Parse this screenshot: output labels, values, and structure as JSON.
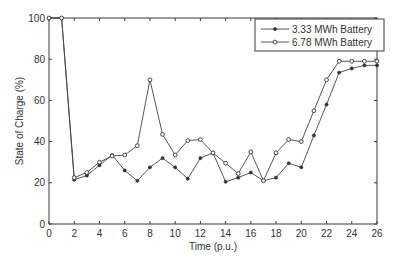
{
  "chart_data": {
    "type": "line",
    "title": "",
    "xlabel": "Time (p.u.)",
    "ylabel": "State of Charge (%)",
    "xlim": [
      0,
      26
    ],
    "ylim": [
      0,
      100
    ],
    "xticks": [
      0,
      2,
      4,
      6,
      8,
      10,
      12,
      14,
      16,
      18,
      20,
      22,
      24,
      26
    ],
    "yticks": [
      0,
      20,
      40,
      60,
      80,
      100
    ],
    "grid": false,
    "legend_position": "upper right",
    "x": [
      0,
      1,
      2,
      3,
      4,
      5,
      6,
      7,
      8,
      9,
      10,
      11,
      12,
      13,
      14,
      15,
      16,
      17,
      18,
      19,
      20,
      21,
      22,
      23,
      24,
      25,
      26
    ],
    "series": [
      {
        "name": "3.33 MWh Battery",
        "marker": "filled-dot",
        "values": [
          100,
          100,
          21.5,
          23.5,
          28.5,
          33.5,
          26,
          21,
          27.5,
          32,
          27.5,
          22,
          32,
          34.5,
          20.5,
          22.5,
          25,
          21,
          22.5,
          29.5,
          27.5,
          43,
          58,
          73.5,
          75.5,
          77,
          77
        ]
      },
      {
        "name": "6.78 MWh Battery",
        "marker": "open-circle",
        "values": [
          100,
          100,
          22.5,
          25,
          30,
          33,
          33.5,
          38,
          70,
          43.5,
          33.5,
          40.5,
          41,
          34.5,
          29.5,
          24.5,
          35,
          21,
          34.5,
          41,
          40,
          55,
          70,
          79,
          79,
          79,
          79
        ]
      }
    ]
  }
}
